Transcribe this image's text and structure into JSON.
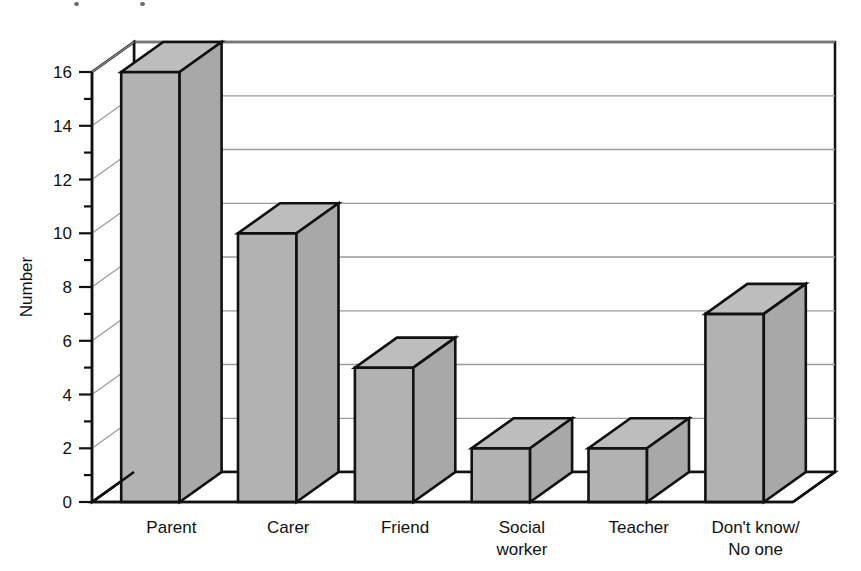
{
  "chart_data": {
    "type": "bar",
    "title": "",
    "subtitle": "",
    "xlabel": "",
    "ylabel": "Number",
    "categories": [
      "Parent",
      "Carer",
      "Friend",
      "Social worker",
      "Teacher",
      "Don't know/No one"
    ],
    "category_lines": [
      [
        "Parent"
      ],
      [
        "Carer"
      ],
      [
        "Friend"
      ],
      [
        "Social",
        "worker"
      ],
      [
        "Teacher"
      ],
      [
        "Don't know/",
        "No one"
      ]
    ],
    "values": [
      16,
      10,
      5,
      2,
      2,
      7
    ],
    "ylim": [
      0,
      16
    ],
    "ytick_labels": [
      "0",
      "2",
      "4",
      "6",
      "8",
      "10",
      "12",
      "14",
      "16"
    ],
    "ytick_values": [
      0,
      2,
      4,
      6,
      8,
      10,
      12,
      14,
      16
    ],
    "yminor_values": [
      1,
      3,
      5,
      7,
      9,
      11,
      13,
      15
    ],
    "grid": true,
    "grid_orientation": "horizontal",
    "legend": "none",
    "style": "3d-bar",
    "bar_fill_color": "#b2b2b2",
    "bar_top_color": "#bdbdbd",
    "bar_side_color": "#a8a8a8",
    "outline_color": "#111111",
    "gridline_color": "#9a9a9a",
    "background_color": "#ffffff"
  },
  "axis": {
    "y_title": "Number"
  }
}
